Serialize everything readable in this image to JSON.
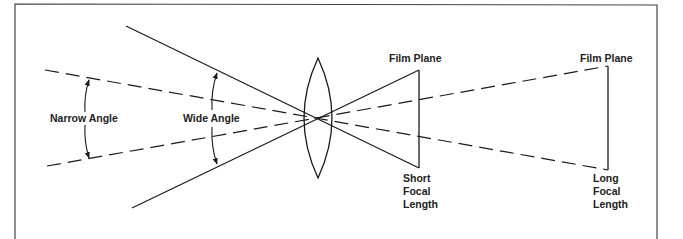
{
  "diagram": {
    "labels": {
      "narrow_angle": "Narrow Angle",
      "wide_angle": "Wide Angle",
      "film_plane_short": "Film Plane",
      "film_plane_long": "Film Plane",
      "short_focal_length": [
        "Short",
        "Focal",
        "Length"
      ],
      "long_focal_length": [
        "Long",
        "Focal",
        "Length"
      ]
    },
    "colors": {
      "line": "#1a1a1a",
      "border": "#444444",
      "background": "#ffffff"
    }
  }
}
